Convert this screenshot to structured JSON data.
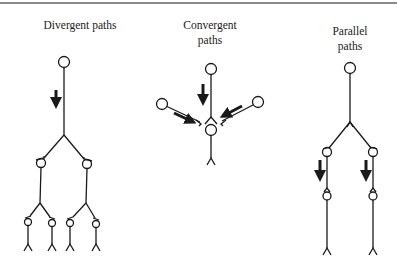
{
  "panels": [
    {
      "id": "divergent",
      "title_lines": [
        "Divergent paths"
      ]
    },
    {
      "id": "convergent",
      "title_lines": [
        "Convergent",
        "paths"
      ]
    },
    {
      "id": "parallel",
      "title_lines": [
        "Parallel",
        "paths"
      ]
    }
  ],
  "colors": {
    "ink": "#1a1a1a",
    "rule": "#8a8a8a",
    "background": "#ffffff"
  }
}
